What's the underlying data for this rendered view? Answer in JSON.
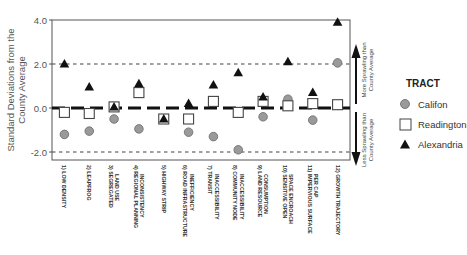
{
  "chart_data": {
    "type": "scatter",
    "title": "",
    "xlabel": "",
    "ylabel": "Standard Deviations from the County Average",
    "ylabel_lines": [
      "Standard Deviations from the",
      "County Average"
    ],
    "ylim": [
      -2.4,
      4.0
    ],
    "yticks": [
      4.0,
      2.0,
      0.0,
      -2.0
    ],
    "ytick_labels": [
      "4.0",
      "2.0",
      "0.0",
      "-2.0"
    ],
    "reference_lines": [
      {
        "y": 2.0,
        "style": "dotted"
      },
      {
        "y": 0.0,
        "style": "thick-dashed"
      },
      {
        "y": -2.0,
        "style": "dotted"
      }
    ],
    "categories": [
      [
        "1) LOW DENSITY"
      ],
      [
        "2) LEAPFROG"
      ],
      [
        "3) SEGREGATED",
        "LAND USE"
      ],
      [
        "4) REGIONAL PLANNING",
        "INCONSISTENCY"
      ],
      [
        "5) HIGHWAY STRIP"
      ],
      [
        "6) ROAD INFRASTRUCTURE",
        "INEFFICIENCY"
      ],
      [
        "7) TRANSIT",
        "INACCESSIBILITY"
      ],
      [
        "8) COMMUNITY NODE",
        "INACCESSIBILITY"
      ],
      [
        "9) LAND RESOURCE",
        "CONSUMPTION"
      ],
      [
        "10) SENSITIVE OPEN",
        "SPACE ENCROACH"
      ],
      [
        "11) IMPERVIOUS SURFACE",
        "PER CAP"
      ],
      [
        "12) GROWTH TRAJECTORY"
      ]
    ],
    "series": [
      {
        "name": "Califon",
        "marker": "circle",
        "color": "#9a9a9a",
        "values": [
          -1.2,
          -1.05,
          -0.5,
          -0.95,
          -0.5,
          -1.1,
          -1.3,
          -1.9,
          -0.4,
          0.4,
          -0.55,
          2.05
        ]
      },
      {
        "name": "Readington",
        "marker": "square",
        "color": "#ffffff",
        "values": [
          -0.2,
          -0.25,
          0.05,
          0.7,
          -0.5,
          -0.5,
          0.3,
          -0.2,
          0.3,
          0.1,
          0.2,
          0.15
        ]
      },
      {
        "name": "Alexandria",
        "marker": "triangle",
        "color": "#111111",
        "values": [
          2.0,
          0.95,
          0.05,
          1.1,
          -0.5,
          0.2,
          1.05,
          1.6,
          0.5,
          2.1,
          0.7,
          3.9
        ]
      }
    ],
    "legend": {
      "title": "TRACT",
      "position": "right",
      "entries": [
        "Califon",
        "Readington",
        "Alexandria"
      ]
    },
    "annotations": {
      "up_arrow": [
        "More Sprawling than",
        "County Average"
      ],
      "down_arrow": [
        "Less Sprawling than",
        "County Average"
      ]
    },
    "grid": false
  },
  "legend": {
    "title": "TRACT",
    "items": [
      {
        "label": "Califon",
        "marker": "circle"
      },
      {
        "label": "Readington",
        "marker": "square"
      },
      {
        "label": "Alexandria",
        "marker": "triangle"
      }
    ]
  }
}
